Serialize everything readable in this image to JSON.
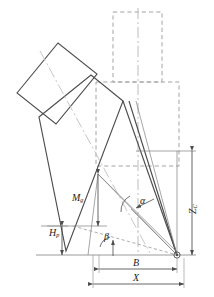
{
  "figure": {
    "type": "engineering-schematic",
    "background_color": "#ffffff",
    "line_color": "#4d4d4d",
    "dash_color": "#9a9a9a",
    "thin_color": "#808080",
    "centerline_color": "#b4b4b4",
    "text_color": "#1a1a1a"
  },
  "labels": {
    "mg": {
      "base": "M",
      "sub": "g",
      "x": 72,
      "y": 194
    },
    "hp": {
      "base": "H",
      "sub": "p",
      "x": 49,
      "y": 229
    },
    "zc": {
      "base": "Z",
      "sub": "C",
      "x": 191,
      "y": 218
    },
    "b": {
      "base": "B",
      "sub": "",
      "x": 134,
      "y": 265
    },
    "x": {
      "base": "X",
      "sub": "",
      "x": 133,
      "y": 279
    },
    "alpha": {
      "base": "α",
      "sub": "",
      "x": 141,
      "y": 203
    },
    "beta": {
      "base": "β",
      "sub": "",
      "x": 105,
      "y": 240
    }
  },
  "dimensions": {
    "mg_label": "Mg",
    "hp_label": "Hp",
    "zc_label": "ZC",
    "b_label": "B",
    "x_label": "X",
    "alpha_label": "α",
    "beta_label": "β"
  },
  "geometry": {
    "pivot": {
      "x": 177,
      "y": 255
    },
    "ground_line_y": 255,
    "b_start_x": 99,
    "x_start_x": 93,
    "zc_top_y": 151,
    "zc_bottom_y": 255
  }
}
